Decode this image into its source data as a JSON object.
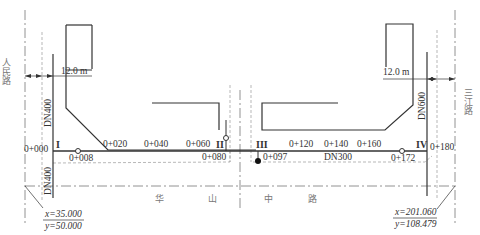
{
  "roads": {
    "left_road": "人民路",
    "right_road": "三江路",
    "main_road_part1": "华",
    "main_road_part2": "山",
    "main_road_part3": "中",
    "main_road_part4": "路"
  },
  "dimensions": {
    "left_offset": "12.0 m",
    "right_offset": "12.0 m"
  },
  "pipes": {
    "left_branch_top": "DN400",
    "left_branch_bottom": "DN400",
    "right_branch": "DN600",
    "main_pipe": "DN300"
  },
  "nodes": {
    "n1": "I",
    "n2": "II",
    "n3": "III",
    "n4": "IV"
  },
  "stations": {
    "s000": "0+000",
    "s008": "0+008",
    "s020": "0+020",
    "s040": "0+040",
    "s060": "0+060",
    "s080": "0+080",
    "s097": "0+097",
    "s120": "0+120",
    "s140": "0+140",
    "s160": "0+160",
    "s172": "0+172",
    "s180": "0+180"
  },
  "coordinates": {
    "start_x": "x=35.000",
    "start_y": "y=50.000",
    "end_x": "x=201.060",
    "end_y": "y=108.479"
  },
  "colors": {
    "line": "#333333",
    "dash": "#888888",
    "text": "#333333"
  }
}
